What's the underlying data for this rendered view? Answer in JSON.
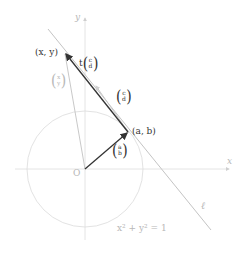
{
  "diagram": {
    "colors": {
      "dark": "#333333",
      "light": "#bbbbbb",
      "axis": "#dddddd",
      "circle": "#e3e3e3",
      "line": "#bdbdbd"
    },
    "axes": {
      "x_label": "x",
      "y_label": "y",
      "origin_label": "O"
    },
    "circle": {
      "equation": "x² + y² = 1"
    },
    "line": {
      "label": "ℓ"
    },
    "points": {
      "ab": "(a, b)",
      "xy": "(x, y)"
    },
    "vectors": {
      "ab": {
        "top": "a",
        "bottom": "b"
      },
      "cd": {
        "top": "c",
        "bottom": "d"
      },
      "tcd": {
        "prefix": "t",
        "top": "c",
        "bottom": "d"
      },
      "xy": {
        "top": "x",
        "bottom": "y"
      }
    }
  }
}
